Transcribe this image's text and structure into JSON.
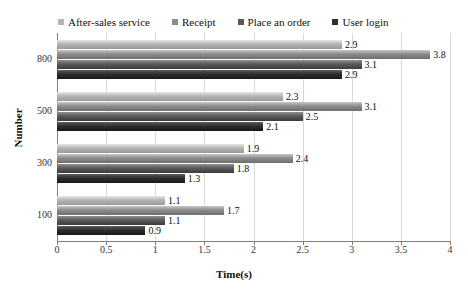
{
  "chart_data": {
    "type": "bar",
    "orientation": "horizontal",
    "title": "",
    "xlabel": "Time(s)",
    "ylabel": "Number",
    "xlim": [
      0,
      4
    ],
    "xticks": [
      "0",
      "0.5",
      "1",
      "1.5",
      "2",
      "2.5",
      "3",
      "3.5",
      "4"
    ],
    "xtick_values": [
      0,
      0.5,
      1,
      1.5,
      2,
      2.5,
      3,
      3.5,
      4
    ],
    "categories": [
      "800",
      "500",
      "300",
      "100"
    ],
    "grid": "vertical",
    "legend_position": "top",
    "series": [
      {
        "name": "After-sales service",
        "color": "#b4b4b4",
        "color_light": "#e8e8e8",
        "color_dark": "#9a9a9a",
        "values": [
          2.9,
          2.3,
          1.9,
          1.1
        ],
        "labels": [
          "2.9",
          "2.3",
          "1.9",
          "1.1"
        ]
      },
      {
        "name": "Receipt",
        "color": "#8c8c8c",
        "color_light": "#c8c8c8",
        "color_dark": "#6e6e6e",
        "values": [
          3.8,
          3.1,
          2.4,
          1.7
        ],
        "labels": [
          "3.8",
          "3.1",
          "2.4",
          "1.7"
        ]
      },
      {
        "name": "Place an order",
        "color": "#5a5a5a",
        "color_light": "#8f8f8f",
        "color_dark": "#3c3c3c",
        "values": [
          3.1,
          2.5,
          1.8,
          1.1
        ],
        "labels": [
          "3.1",
          "2.5",
          "1.8",
          "1.1"
        ]
      },
      {
        "name": "User login",
        "color": "#2e2e2e",
        "color_light": "#5e5e5e",
        "color_dark": "#171717",
        "values": [
          2.9,
          2.1,
          1.3,
          0.9
        ],
        "labels": [
          "2.9",
          "2.1",
          "1.3",
          "0.9"
        ]
      }
    ]
  }
}
